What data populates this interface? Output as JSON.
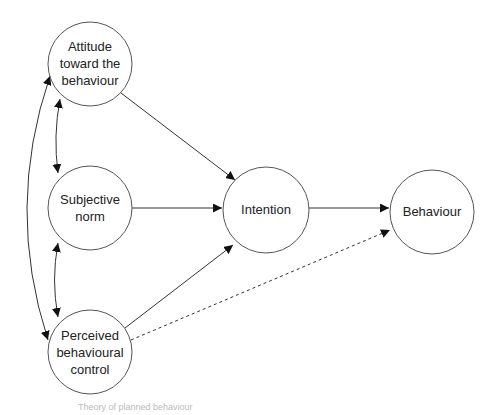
{
  "diagram": {
    "title": "Theory of planned behaviour",
    "nodes": [
      {
        "id": "attitude",
        "lines": [
          "Attitude",
          "toward the",
          "behaviour"
        ],
        "cx": 90,
        "cy": 64,
        "r": 42
      },
      {
        "id": "subjective_norm",
        "lines": [
          "Subjective",
          "norm"
        ],
        "cx": 90,
        "cy": 208,
        "r": 42
      },
      {
        "id": "pbc",
        "lines": [
          "Perceived",
          "behavioural",
          "control"
        ],
        "cx": 90,
        "cy": 352,
        "r": 42
      },
      {
        "id": "intention",
        "lines": [
          "Intention"
        ],
        "cx": 266,
        "cy": 210,
        "r": 43
      },
      {
        "id": "behaviour",
        "lines": [
          "Behaviour"
        ],
        "cx": 432,
        "cy": 212,
        "r": 42
      }
    ],
    "edges": [
      {
        "from": "attitude",
        "to": "intention",
        "style": "solid"
      },
      {
        "from": "subjective_norm",
        "to": "intention",
        "style": "solid"
      },
      {
        "from": "pbc",
        "to": "intention",
        "style": "solid"
      },
      {
        "from": "intention",
        "to": "behaviour",
        "style": "solid"
      },
      {
        "from": "pbc",
        "to": "behaviour",
        "style": "dashed"
      },
      {
        "from": "attitude",
        "to": "subjective_norm",
        "style": "bidirectional"
      },
      {
        "from": "subjective_norm",
        "to": "pbc",
        "style": "bidirectional"
      },
      {
        "from": "attitude",
        "to": "pbc",
        "style": "bidirectional"
      }
    ]
  },
  "caption": "Theory of planned behaviour"
}
